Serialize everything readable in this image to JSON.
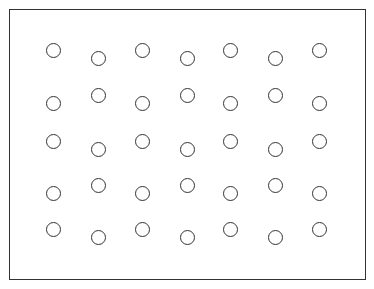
{
  "figure": {
    "background": "#ffffff",
    "stroke_color": "#333333",
    "frame": {
      "x": 9,
      "y": 9,
      "width": 357,
      "height": 271
    },
    "circle_radius": 7.5,
    "columns_x": [
      53,
      98,
      142,
      187,
      230,
      275,
      319
    ],
    "rows": [
      {
        "high_y": 50,
        "low_y": 58,
        "odd_columns": "high"
      },
      {
        "high_y": 95,
        "low_y": 103,
        "odd_columns": "low"
      },
      {
        "high_y": 141,
        "low_y": 149,
        "odd_columns": "high"
      },
      {
        "high_y": 185,
        "low_y": 193,
        "odd_columns": "low"
      },
      {
        "high_y": 229,
        "low_y": 237,
        "odd_columns": "high"
      }
    ],
    "circle_count": 35
  }
}
